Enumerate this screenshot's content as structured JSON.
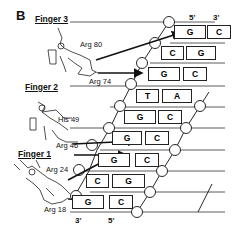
{
  "panel_label": "B",
  "fingers": [
    {
      "name": "Finger 3",
      "residues": [
        "Arg 80",
        "Arg 74"
      ]
    },
    {
      "name": "Finger 2",
      "residues": [
        "His 49",
        "Arg 46"
      ]
    },
    {
      "name": "Finger 1",
      "residues": [
        "Arg 24",
        "Arg 18"
      ]
    }
  ],
  "strand_ends": {
    "top_left": "5'",
    "top_right": "3'",
    "bottom_left": "3'",
    "bottom_right": "5'"
  },
  "base_pairs": [
    {
      "left": "G",
      "right": "C"
    },
    {
      "left": "C",
      "right": "G"
    },
    {
      "left": "G",
      "right": "C"
    },
    {
      "left": "T",
      "right": "A"
    },
    {
      "left": "G",
      "right": "C"
    },
    {
      "left": "G",
      "right": "C"
    },
    {
      "left": "G",
      "right": "C"
    },
    {
      "left": "C",
      "right": "G"
    },
    {
      "left": "G",
      "right": "C"
    }
  ],
  "colors": {
    "ink": "#111111",
    "background": "#ffffff"
  }
}
